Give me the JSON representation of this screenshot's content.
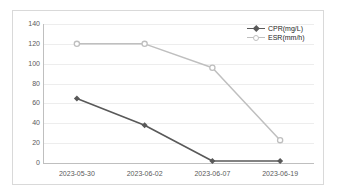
{
  "chart_data": {
    "type": "line",
    "title": "",
    "xlabel": "",
    "ylabel": "",
    "categories": [
      "2023-05-30",
      "2023-06-02",
      "2023-06-07",
      "2023-06-19"
    ],
    "series": [
      {
        "name": "CPR(mg/L)",
        "color": "#595959",
        "marker": "filled-diamond",
        "values": [
          65,
          38,
          2,
          2
        ]
      },
      {
        "name": "ESR(mm/h)",
        "color": "#bfbfbf",
        "marker": "open-circle",
        "values": [
          120,
          120,
          96,
          23
        ]
      }
    ],
    "ylim": [
      0,
      140
    ],
    "yticks": [
      0,
      20,
      40,
      60,
      80,
      100,
      120,
      140
    ],
    "ytick_labels": [
      "0",
      "20",
      "40",
      "60",
      "80",
      "100",
      "120",
      "140"
    ],
    "grid": "horizontal",
    "legend_position": "top-right",
    "legend": [
      "CPR(mg/L)",
      "ESR(mm/h)"
    ],
    "axis_color": "#bfbfbf",
    "grid_color": "#ededed",
    "background": "#ffffff",
    "border_color": "#d9d9d9"
  }
}
